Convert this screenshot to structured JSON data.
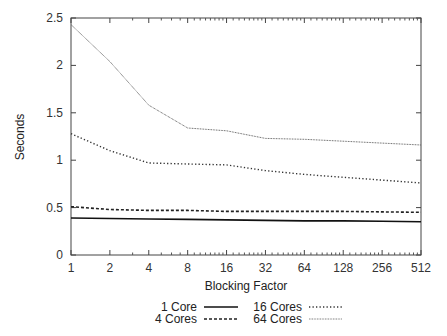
{
  "chart_data": {
    "type": "line",
    "title": "",
    "xlabel": "Blocking Factor",
    "ylabel": "Seconds",
    "x_scale": "log2",
    "categories": [
      "1",
      "2",
      "4",
      "8",
      "16",
      "32",
      "64",
      "128",
      "256",
      "512"
    ],
    "x": [
      1,
      2,
      4,
      8,
      16,
      32,
      64,
      128,
      256,
      512
    ],
    "ylim": [
      0,
      2.5
    ],
    "yticks": [
      "0",
      "0.5",
      "1",
      "1.5",
      "2",
      "2.5"
    ],
    "ytick_values": [
      0,
      0.5,
      1,
      1.5,
      2,
      2.5
    ],
    "grid": false,
    "legend_position": "bottom",
    "series": [
      {
        "name": "1 Core",
        "style": "solid",
        "color": "#111111",
        "values": [
          0.39,
          0.385,
          0.38,
          0.375,
          0.37,
          0.365,
          0.36,
          0.36,
          0.355,
          0.35
        ]
      },
      {
        "name": "4 Cores",
        "style": "dashed",
        "color": "#222222",
        "values": [
          0.51,
          0.48,
          0.47,
          0.47,
          0.46,
          0.46,
          0.46,
          0.46,
          0.455,
          0.45
        ]
      },
      {
        "name": "16 Cores",
        "style": "dotted",
        "color": "#333333",
        "values": [
          1.28,
          1.1,
          0.97,
          0.96,
          0.95,
          0.89,
          0.85,
          0.82,
          0.79,
          0.76
        ]
      },
      {
        "name": "64 Cores",
        "style": "fine-dotted",
        "color": "#555555",
        "values": [
          2.43,
          2.04,
          1.58,
          1.34,
          1.31,
          1.23,
          1.22,
          1.2,
          1.18,
          1.16
        ]
      }
    ]
  },
  "legend": {
    "items": [
      {
        "label": "1 Core"
      },
      {
        "label": "4 Cores"
      },
      {
        "label": "16 Cores"
      },
      {
        "label": "64 Cores"
      }
    ]
  }
}
